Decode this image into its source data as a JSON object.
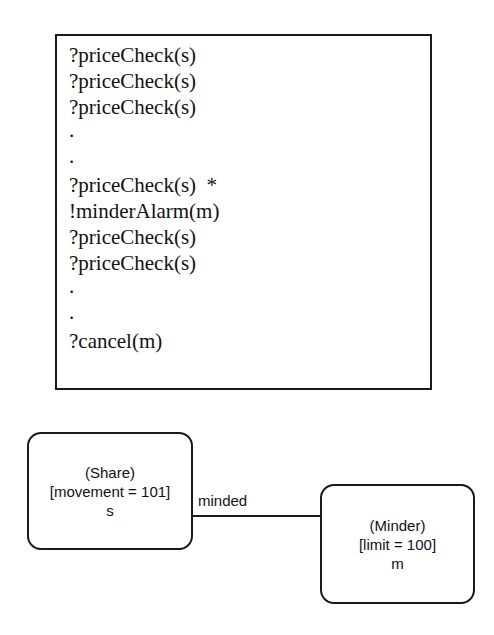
{
  "diagram": {
    "trace_box": {
      "lines": [
        {
          "kind": "event",
          "text": "?priceCheck(s)"
        },
        {
          "kind": "event",
          "text": "?priceCheck(s)"
        },
        {
          "kind": "event",
          "text": "?priceCheck(s)"
        },
        {
          "kind": "dot",
          "text": "."
        },
        {
          "kind": "dot",
          "text": "."
        },
        {
          "kind": "event",
          "text": "?priceCheck(s)  *"
        },
        {
          "kind": "event",
          "text": "!minderAlarm(m)"
        },
        {
          "kind": "event",
          "text": "?priceCheck(s)"
        },
        {
          "kind": "event",
          "text": "?priceCheck(s)"
        },
        {
          "kind": "dot",
          "text": "."
        },
        {
          "kind": "dot",
          "text": "."
        },
        {
          "kind": "event",
          "text": "?cancel(m)"
        }
      ]
    },
    "nodes": [
      {
        "id": "share",
        "class_name": "(Share)",
        "attribute": "[movement = 101]",
        "instance": "s"
      },
      {
        "id": "minder",
        "class_name": "(Minder)",
        "attribute": "[limit = 100]",
        "instance": "m"
      }
    ],
    "link": {
      "label": "minded"
    }
  }
}
